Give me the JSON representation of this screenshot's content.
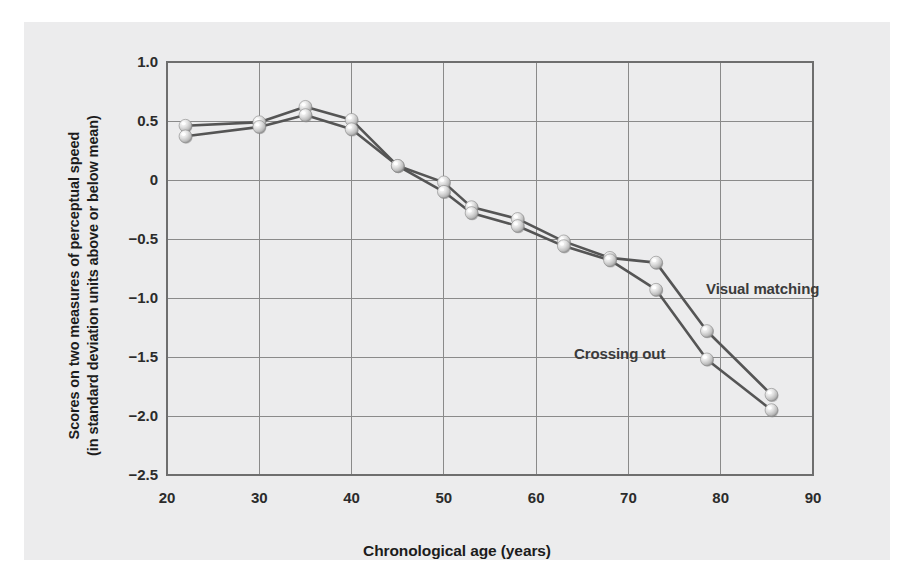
{
  "axes": {
    "x_title": "Chronological age (years)",
    "y_title_line1": "Scores on two measures of perceptual speed",
    "y_title_line2": "(in standard deviation units above or below mean)",
    "x_ticks": [
      "20",
      "30",
      "40",
      "50",
      "60",
      "70",
      "80",
      "90"
    ],
    "y_ticks": [
      "1.0",
      "0.5",
      "0",
      "−0.5",
      "−1.0",
      "−1.5",
      "−2.0",
      "−2.5"
    ]
  },
  "labels": {
    "visual_matching": "Visual matching",
    "crossing_out": "Crossing out"
  },
  "colors": {
    "panel_background": "#ececed",
    "plot_background": "#ececed",
    "grid_line": "#8a8a8a",
    "axis_line": "#6e6e6e",
    "line_series": "#555555",
    "marker_fill": "#d2d2d2",
    "marker_highlight": "#fbfbfb",
    "marker_shadow": "#8e8e8e",
    "text": "#1c1c1c"
  },
  "chart_data": {
    "type": "line",
    "title": "",
    "xlabel": "Chronological age (years)",
    "ylabel": "Scores on two measures of perceptual speed (in standard deviation units above or below mean)",
    "xlim": [
      20,
      90
    ],
    "ylim": [
      -2.5,
      1.0
    ],
    "xticks": [
      20,
      30,
      40,
      50,
      60,
      70,
      80,
      90
    ],
    "yticks": [
      1.0,
      0.5,
      0,
      -0.5,
      -1.0,
      -1.5,
      -2.0,
      -2.5
    ],
    "grid": true,
    "legend_position": "inline-annotation",
    "series": [
      {
        "name": "Visual matching",
        "x": [
          22,
          30,
          35,
          40,
          45,
          50,
          53,
          58,
          63,
          68,
          73,
          78.5,
          85.5
        ],
        "values": [
          0.46,
          0.49,
          0.62,
          0.51,
          0.12,
          -0.02,
          -0.23,
          -0.33,
          -0.52,
          -0.66,
          -0.7,
          -1.28,
          -1.82
        ]
      },
      {
        "name": "Crossing out",
        "x": [
          22,
          30,
          35,
          40,
          45,
          50,
          53,
          58,
          63,
          68,
          73,
          78.5,
          85.5
        ],
        "values": [
          0.37,
          0.45,
          0.55,
          0.43,
          0.12,
          -0.1,
          -0.28,
          -0.39,
          -0.56,
          -0.68,
          -0.93,
          -1.52,
          -1.95
        ]
      }
    ],
    "annotations": [
      {
        "text": "Visual matching",
        "x": 75.5,
        "y": -0.72
      },
      {
        "text": "Crossing out",
        "x": 60.0,
        "y": -1.28
      }
    ]
  }
}
